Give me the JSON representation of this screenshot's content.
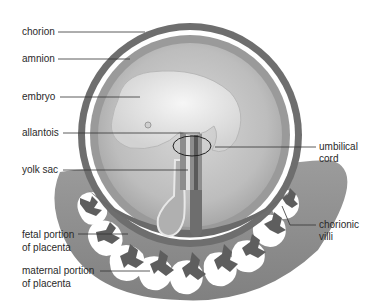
{
  "diagram": {
    "labels": {
      "chorion": "chorion",
      "amnion": "amnion",
      "embryo": "embryo",
      "allantois": "allantois",
      "yolk_sac": "yolk sac",
      "umbilical_cord_line1": "umbilical",
      "umbilical_cord_line2": "cord",
      "fetal_portion_line1": "fetal portion",
      "fetal_portion_line2": "of placenta",
      "maternal_portion_line1": "maternal portion",
      "maternal_portion_line2": "of placenta",
      "chorionic_villi_line1": "chorionic",
      "chorionic_villi_line2": "villi"
    },
    "colors": {
      "chorion": "#6e6e6e",
      "amnion": "#9a9a9a",
      "amniotic_fluid": "#c4c4c4",
      "embryo": "#ececec",
      "maternal_tissue": "#7a7a7a",
      "leader_line": "#333333"
    }
  }
}
